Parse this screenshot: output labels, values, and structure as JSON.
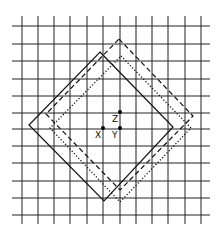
{
  "diagram": {
    "grid": {
      "x_lines": [
        22,
        38,
        54,
        70,
        87,
        103,
        120,
        136,
        152,
        168,
        185,
        201
      ],
      "y_lines": [
        26,
        44,
        61,
        79,
        96,
        113,
        129,
        146,
        163,
        181,
        198,
        215
      ],
      "x_extent": [
        12,
        210
      ],
      "y_extent": [
        16,
        224
      ],
      "color": "#222222"
    },
    "squares": [
      {
        "name": "solid-square",
        "style": "solid",
        "points": "100,52 173,127 104,201 29,125"
      },
      {
        "name": "dashed-square",
        "style": "dashed",
        "points": "119,39 193,116 120,190 46,114"
      },
      {
        "name": "dotted-square",
        "style": "dotted",
        "points": "121,56 191,128 120,202 50,128"
      }
    ],
    "points": [
      {
        "label": "X",
        "x": 103,
        "y": 128
      },
      {
        "label": "Y",
        "x": 120,
        "y": 128
      },
      {
        "label": "Z",
        "x": 120,
        "y": 112
      }
    ]
  }
}
